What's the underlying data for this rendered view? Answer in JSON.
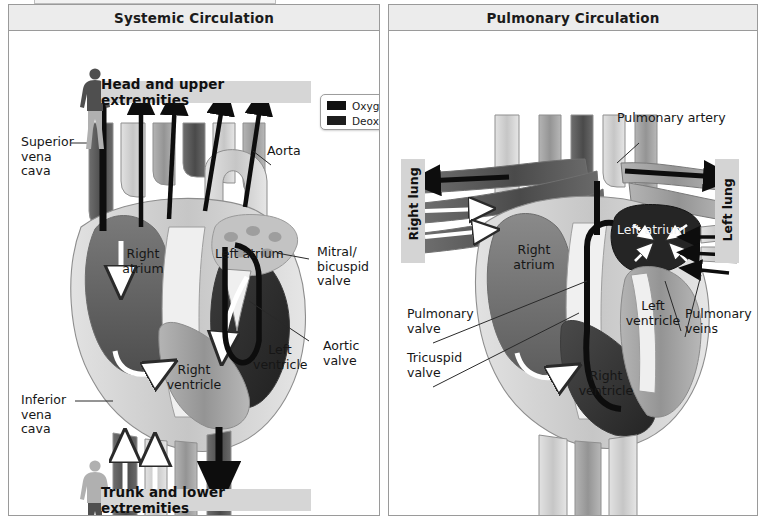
{
  "window": {
    "title_stub": ""
  },
  "legend": {
    "name": "blood-type-legend",
    "items": [
      {
        "label": "Oxygenated blood",
        "color": "#111111"
      },
      {
        "label": "Deoxygenated blood",
        "color": "#1d1d1d"
      }
    ]
  },
  "panels": [
    {
      "id": "systemic",
      "title": "Systemic Circulation",
      "banners": [
        {
          "id": "head",
          "text": "Head and upper extremities"
        },
        {
          "id": "trunk",
          "text": "Trunk and lower extremities"
        }
      ],
      "labels": [
        {
          "id": "superior-vena-cava",
          "text": "Superior\nvena cava"
        },
        {
          "id": "inferior-vena-cava",
          "text": "Inferior\nvena cava"
        },
        {
          "id": "aorta",
          "text": "Aorta"
        },
        {
          "id": "right-atrium",
          "text": "Right\natrium"
        },
        {
          "id": "right-ventricle",
          "text": "Right\nventricle"
        },
        {
          "id": "left-atrium",
          "text": "Left atrium"
        },
        {
          "id": "left-ventricle",
          "text": "Left\nventricle"
        },
        {
          "id": "mitral-bicuspid-valve",
          "text": "Mitral/\nbicuspid\nvalve"
        },
        {
          "id": "aortic-valve",
          "text": "Aortic\nvalve"
        }
      ]
    },
    {
      "id": "pulmonary",
      "title": "Pulmonary Circulation",
      "lungs": [
        {
          "id": "right-lung",
          "text": "Right lung"
        },
        {
          "id": "left-lung",
          "text": "Left lung"
        }
      ],
      "labels": [
        {
          "id": "pulmonary-artery",
          "text": "Pulmonary artery"
        },
        {
          "id": "pulmonary-valve",
          "text": "Pulmonary\nvalve"
        },
        {
          "id": "tricuspid-valve",
          "text": "Tricuspid\nvalve"
        },
        {
          "id": "pulmonary-veins",
          "text": "Pulmonary\nveins"
        },
        {
          "id": "right-atrium",
          "text": "Right\natrium"
        },
        {
          "id": "right-ventricle",
          "text": "Right\nventricle"
        },
        {
          "id": "left-atrium",
          "text": "Left atrium"
        },
        {
          "id": "left-ventricle",
          "text": "Left\nventricle"
        }
      ]
    }
  ],
  "colors": {
    "panel_border": "#9a9a9a",
    "header_bg": "#ececec",
    "banner_bg": "#d6d6d6",
    "oxygenated": "#111111",
    "deoxygenated": "#1d1d1d",
    "heart_dark": "#5a5a5a",
    "heart_mid": "#9c9c9c",
    "heart_light": "#cfcfcf"
  }
}
